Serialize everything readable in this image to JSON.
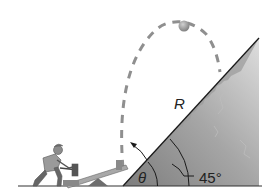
{
  "figure": {
    "labels": {
      "range": "R",
      "launch_angle": "θ",
      "slope_angle": "45°"
    },
    "colors": {
      "slope_dark": "#8a8a8a",
      "slope_light": "#d9d9d9",
      "trajectory": "#8f8f8f",
      "ball": "#9a9a9a",
      "line": "#1a1a1a"
    },
    "elements": [
      "person-with-hammer",
      "seesaw-launcher",
      "projectile-ball",
      "dashed-trajectory",
      "45-degree-slope",
      "angle-arcs"
    ]
  }
}
